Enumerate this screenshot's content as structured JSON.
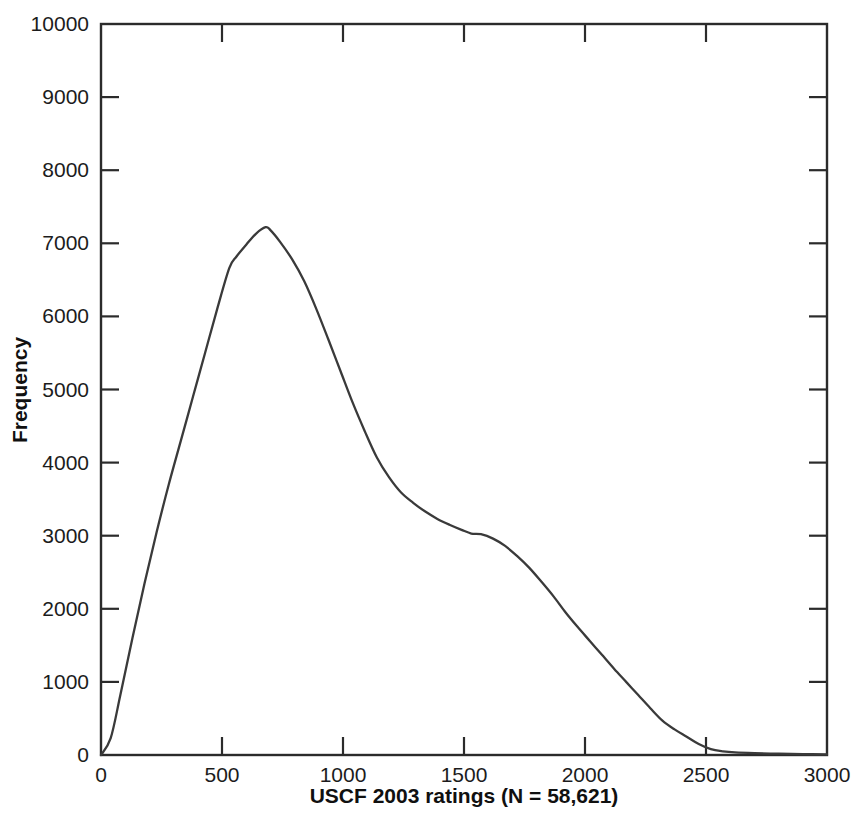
{
  "figure": {
    "width": 863,
    "height": 826,
    "background": "#ffffff",
    "line_color": "#3a3a3a",
    "axis_color": "#2b2b2b",
    "text_color": "#1c1c1c"
  },
  "chart_data": {
    "type": "line",
    "title": "",
    "xlabel": "USCF 2003 ratings (N = 58,621)",
    "ylabel": "Frequency",
    "xlim": [
      0,
      3000
    ],
    "ylim": [
      0,
      10000
    ],
    "xticks": [
      0,
      500,
      1000,
      1500,
      2000,
      2500,
      3000
    ],
    "xticklabels": [
      "0",
      "500",
      "1000",
      "1500",
      "2000",
      "2500",
      "3000"
    ],
    "yticks": [
      0,
      1000,
      2000,
      3000,
      4000,
      5000,
      6000,
      7000,
      8000,
      9000,
      10000
    ],
    "yticklabels": [
      "0",
      "1000",
      "2000",
      "3000",
      "4000",
      "5000",
      "6000",
      "7000",
      "8000",
      "9000",
      "10000"
    ],
    "grid": false,
    "legend": false,
    "tick_direction": "in",
    "frame": "box",
    "series": [
      {
        "name": "USCF 2003 rating distribution",
        "x": [
          0,
          40,
          80,
          130,
          180,
          230,
          280,
          330,
          380,
          430,
          480,
          530,
          560,
          600,
          640,
          680,
          700,
          740,
          790,
          840,
          890,
          940,
          990,
          1040,
          1090,
          1140,
          1190,
          1240,
          1290,
          1340,
          1390,
          1440,
          1490,
          1530,
          1570,
          1620,
          1670,
          1720,
          1770,
          1820,
          1870,
          1920,
          1970,
          2020,
          2070,
          2120,
          2170,
          2220,
          2270,
          2320,
          2370,
          2420,
          2470,
          2520,
          2570,
          2620,
          2700,
          2800,
          2900,
          3000
        ],
        "y": [
          0,
          230,
          820,
          1600,
          2350,
          3050,
          3700,
          4300,
          4900,
          5500,
          6100,
          6660,
          6820,
          6980,
          7130,
          7220,
          7180,
          7020,
          6780,
          6480,
          6100,
          5680,
          5250,
          4820,
          4430,
          4070,
          3800,
          3590,
          3450,
          3330,
          3230,
          3150,
          3080,
          3030,
          3020,
          2960,
          2860,
          2720,
          2560,
          2370,
          2170,
          1950,
          1750,
          1560,
          1370,
          1180,
          1000,
          820,
          640,
          470,
          350,
          250,
          150,
          80,
          50,
          35,
          25,
          18,
          12,
          8
        ],
        "peak": {
          "x": 680,
          "y": 7220
        },
        "shoulder": {
          "x": 1530,
          "y": 3030
        }
      }
    ]
  },
  "axes": {
    "x_axis_label": "USCF 2003 ratings (N = 58,621)",
    "y_axis_label": "Frequency"
  }
}
